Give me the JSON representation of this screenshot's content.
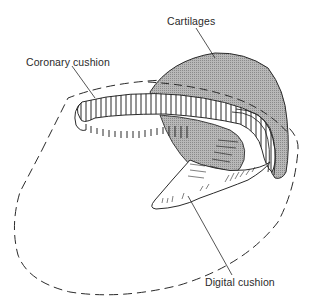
{
  "figure": {
    "labels": {
      "cartilages": "Cartilages",
      "coronary_cushion": "Coronary cushion",
      "digital_cushion": "Digital cushion"
    },
    "colors": {
      "line": "#2a2a2a",
      "cartilage_fill": "#a9a9a9",
      "background": "#ffffff"
    }
  }
}
